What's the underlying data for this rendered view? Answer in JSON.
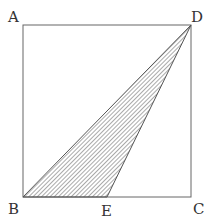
{
  "diagram": {
    "type": "geometry-square-with-shaded-triangle",
    "points": {
      "A": {
        "label": "A",
        "x": 23,
        "y": 25
      },
      "B": {
        "label": "B",
        "x": 23,
        "y": 197
      },
      "C": {
        "label": "C",
        "x": 191,
        "y": 197
      },
      "D": {
        "label": "D",
        "x": 191,
        "y": 25
      },
      "E": {
        "label": "E",
        "x": 107,
        "y": 197
      }
    },
    "shaded_region": [
      "B",
      "E",
      "D"
    ],
    "colors": {
      "stroke": "#555555",
      "hatch": "#555555",
      "label": "#333333"
    }
  }
}
